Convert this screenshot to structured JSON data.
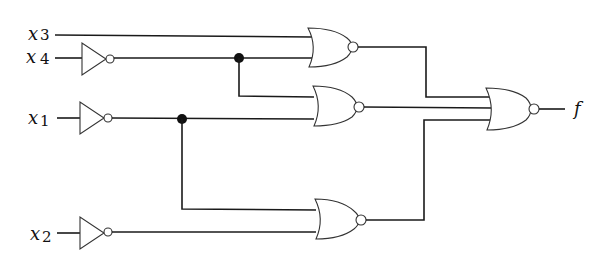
{
  "diagram": {
    "type": "logic-circuit",
    "inputs": [
      {
        "id": "x3",
        "var": "x",
        "sub": "3",
        "inverted": false
      },
      {
        "id": "x4",
        "var": "x",
        "sub": "4",
        "inverted": true
      },
      {
        "id": "x1",
        "var": "x",
        "sub": "1",
        "inverted": true
      },
      {
        "id": "x2",
        "var": "x",
        "sub": "2",
        "inverted": true
      }
    ],
    "gates": [
      {
        "id": "nor1",
        "type": "NOR",
        "inputs": [
          "x3",
          "NOT x4"
        ]
      },
      {
        "id": "nor2",
        "type": "NOR",
        "inputs": [
          "NOT x4",
          "NOT x1"
        ]
      },
      {
        "id": "nor3",
        "type": "NOR",
        "inputs": [
          "NOT x1",
          "NOT x2"
        ]
      },
      {
        "id": "nor_out",
        "type": "NOR",
        "inputs": [
          "nor1",
          "nor2",
          "nor3"
        ]
      }
    ],
    "output": {
      "label": "f"
    }
  }
}
